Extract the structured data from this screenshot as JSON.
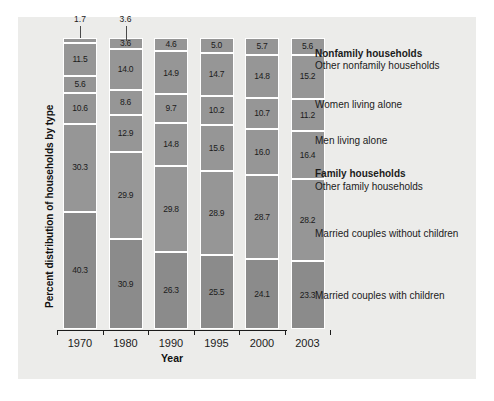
{
  "chart_data": {
    "type": "bar",
    "subtype": "stacked-bar-100-percent",
    "title": "",
    "xlabel": "Year",
    "ylabel": "Percent distribution of households by type",
    "categories": [
      "1970",
      "1980",
      "1990",
      "1995",
      "2000",
      "2003"
    ],
    "ylim": [
      0,
      100
    ],
    "grid": false,
    "legend_position": "right-annotations",
    "stack_order": "bottom-to-top",
    "series": [
      {
        "name": "Married couples with children",
        "group": "Family households",
        "values": [
          40.3,
          30.9,
          26.3,
          25.5,
          24.1,
          23.3
        ]
      },
      {
        "name": "Married couples without children",
        "group": "Family households",
        "values": [
          30.3,
          29.9,
          29.8,
          28.9,
          28.7,
          28.2
        ]
      },
      {
        "name": "Other family households",
        "group": "Family households",
        "values": [
          10.6,
          12.9,
          14.8,
          15.6,
          16.0,
          16.4
        ]
      },
      {
        "name": "Men living alone",
        "group": "Nonfamily households",
        "values": [
          5.6,
          8.6,
          9.7,
          10.2,
          10.7,
          11.2
        ]
      },
      {
        "name": "Women living alone",
        "group": "Nonfamily households",
        "values": [
          11.5,
          14.0,
          14.9,
          14.7,
          14.8,
          15.2
        ]
      },
      {
        "name": "Other nonfamily households",
        "group": "Nonfamily households",
        "values": [
          1.7,
          3.6,
          4.6,
          5.0,
          5.7,
          5.6
        ]
      }
    ],
    "callout_values": [
      "1.7",
      "3.6"
    ],
    "annotations": [
      {
        "text": "Nonfamily households",
        "bold": true,
        "leader": false
      },
      {
        "text": "Other nonfamily households",
        "bold": false,
        "leader": true
      },
      {
        "text": "Women living alone",
        "bold": false,
        "leader": true
      },
      {
        "text": "Men living alone",
        "bold": false,
        "leader": true
      },
      {
        "text": "Family households",
        "bold": true,
        "leader": false
      },
      {
        "text": "Other family households",
        "bold": false,
        "leader": true
      },
      {
        "text": "Married couples without children",
        "bold": false,
        "leader": true
      },
      {
        "text": "Married couples with children",
        "bold": false,
        "leader": true
      }
    ],
    "colors": {
      "segment": "#969696",
      "segment_bottom": "#8b8b8b",
      "panel_background": "#ececea",
      "segment_border": "#ffffff",
      "axis": "#1b1b1b",
      "text": "#1b1b1b"
    }
  }
}
